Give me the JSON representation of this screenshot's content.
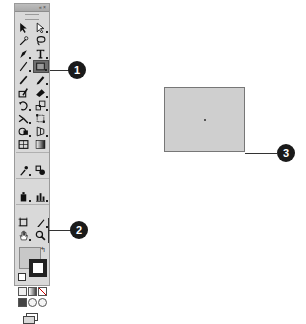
{
  "toolbar": {
    "title_controls": "«  ×",
    "tools": [
      {
        "name": "selection-tool",
        "label": "Selection"
      },
      {
        "name": "direct-selection-tool",
        "label": "Direct Selection"
      },
      {
        "name": "magic-wand-tool",
        "label": "Magic Wand"
      },
      {
        "name": "lasso-tool",
        "label": "Lasso"
      },
      {
        "name": "pen-tool",
        "label": "Pen"
      },
      {
        "name": "type-tool",
        "label": "Type"
      },
      {
        "name": "line-segment-tool",
        "label": "Line Segment"
      },
      {
        "name": "rectangle-tool",
        "label": "Rectangle",
        "active": true
      },
      {
        "name": "paintbrush-tool",
        "label": "Paintbrush"
      },
      {
        "name": "pencil-tool",
        "label": "Pencil"
      },
      {
        "name": "blob-brush-tool",
        "label": "Blob Brush"
      },
      {
        "name": "eraser-tool",
        "label": "Eraser"
      },
      {
        "name": "rotate-tool",
        "label": "Rotate"
      },
      {
        "name": "scale-tool",
        "label": "Scale"
      },
      {
        "name": "warp-tool",
        "label": "Warp"
      },
      {
        "name": "free-transform-tool",
        "label": "Free Transform"
      },
      {
        "name": "shape-builder-tool",
        "label": "Shape Builder"
      },
      {
        "name": "perspective-grid-tool",
        "label": "Perspective Grid"
      },
      {
        "name": "mesh-tool",
        "label": "Mesh"
      },
      {
        "name": "gradient-tool",
        "label": "Gradient"
      },
      {
        "name": "eyedropper-tool",
        "label": "Eyedropper"
      },
      {
        "name": "blend-tool",
        "label": "Blend"
      },
      {
        "name": "symbol-sprayer-tool",
        "label": "Symbol Sprayer"
      },
      {
        "name": "column-graph-tool",
        "label": "Column Graph"
      },
      {
        "name": "artboard-tool",
        "label": "Artboard"
      },
      {
        "name": "slice-tool",
        "label": "Slice"
      },
      {
        "name": "hand-tool",
        "label": "Hand"
      },
      {
        "name": "zoom-tool",
        "label": "Zoom"
      }
    ],
    "swap_glyph": "↰",
    "fill_color": "#c8c8c8",
    "stroke_color": "#222222"
  },
  "callouts": [
    {
      "number": "1"
    },
    {
      "number": "2"
    },
    {
      "number": "3"
    }
  ],
  "canvas": {
    "rectangle_fill": "#cfcfcf",
    "rectangle_stroke": "#777777"
  }
}
